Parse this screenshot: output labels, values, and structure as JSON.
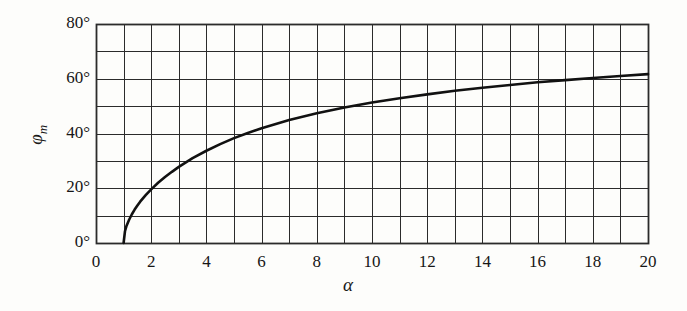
{
  "chart_data": {
    "type": "line",
    "title": "",
    "subtitle": "",
    "xlabel": "α",
    "ylabel": "φ",
    "ylabel_sub": "m",
    "xlim": [
      0,
      20
    ],
    "ylim": [
      0,
      80
    ],
    "x_tick_labels": [
      "0",
      "2",
      "4",
      "6",
      "8",
      "10",
      "12",
      "14",
      "16",
      "18",
      "20"
    ],
    "x_tick_values": [
      0,
      2,
      4,
      6,
      8,
      10,
      12,
      14,
      16,
      18,
      20
    ],
    "x_minor_step": 1,
    "y_tick_labels": [
      "0°",
      "20°",
      "40°",
      "60°",
      "80°"
    ],
    "y_tick_values": [
      0,
      20,
      40,
      60,
      80
    ],
    "y_minor_step": 10,
    "grid": true,
    "grid_color": "#2b2b2b",
    "line_color": "#111111",
    "legend": null,
    "annotations": [],
    "x": [
      1.0,
      1.05,
      1.1,
      1.2,
      1.3,
      1.4,
      1.5,
      1.6,
      1.8,
      2.0,
      2.25,
      2.5,
      2.75,
      3.0,
      3.5,
      4.0,
      4.5,
      5.0,
      5.5,
      6.0,
      7.0,
      8.0,
      9.0,
      10.0,
      11.0,
      12.0,
      13.0,
      14.0,
      15.0,
      16.0,
      17.0,
      18.0,
      19.0,
      20.0
    ],
    "y": [
      0.0,
      4.3,
      6.1,
      8.5,
      10.5,
      12.2,
      13.7,
      15.1,
      17.5,
      19.6,
      22.0,
      24.1,
      26.0,
      27.8,
      31.0,
      33.7,
      36.1,
      38.3,
      40.2,
      41.9,
      44.9,
      47.4,
      49.5,
      51.3,
      52.9,
      54.3,
      55.6,
      56.7,
      57.7,
      58.7,
      59.5,
      60.3,
      61.0,
      61.7
    ]
  },
  "y_axis": {
    "labels": [
      {
        "text": "80°",
        "value": 80
      },
      {
        "text": "60°",
        "value": 60
      },
      {
        "text": "40°",
        "value": 40
      },
      {
        "text": "20°",
        "value": 20
      },
      {
        "text": "0°",
        "value": 0
      }
    ]
  },
  "x_axis": {
    "labels": [
      {
        "text": "0",
        "value": 0
      },
      {
        "text": "2",
        "value": 2
      },
      {
        "text": "4",
        "value": 4
      },
      {
        "text": "6",
        "value": 6
      },
      {
        "text": "8",
        "value": 8
      },
      {
        "text": "10",
        "value": 10
      },
      {
        "text": "12",
        "value": 12
      },
      {
        "text": "14",
        "value": 14
      },
      {
        "text": "16",
        "value": 16
      },
      {
        "text": "18",
        "value": 18
      },
      {
        "text": "20",
        "value": 20
      }
    ]
  },
  "labels": {
    "y_axis_title_main": "φ",
    "y_axis_title_sub": "m",
    "x_axis_title": "α"
  }
}
